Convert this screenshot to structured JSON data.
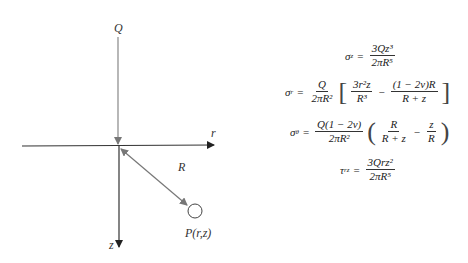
{
  "diagram": {
    "labels": {
      "load": "Q",
      "r_axis": "r",
      "z_axis": "z",
      "distance": "R",
      "point": "P(r,z)"
    },
    "colors": {
      "axis": "#333333",
      "grey_line": "#888888",
      "background": "#ffffff"
    }
  },
  "equations": {
    "sigma_z": {
      "lhs": "σ",
      "sub": "z",
      "eq": "=",
      "num": "3Qz³",
      "den": "2πR⁵"
    },
    "sigma_r": {
      "lhs": "σ",
      "sub": "r",
      "eq": "=",
      "coef_num": "Q",
      "coef_den": "2πR²",
      "t1_num": "3r²z",
      "t1_den": "R³",
      "minus": "−",
      "t2_num": "(1 − 2v)R",
      "t2_den": "R + z",
      "lbr": "[",
      "rbr": "]"
    },
    "sigma_theta": {
      "lhs": "σ",
      "sub": "θ",
      "eq": "=",
      "coef_num": "Q(1 − 2v)",
      "coef_den": "2πR²",
      "t1_num": "R",
      "t1_den": "R + z",
      "minus": "−",
      "t2_num": "z",
      "t2_den": "R",
      "lbr": "(",
      "rbr": ")"
    },
    "tau_rz": {
      "lhs": "τ",
      "sub": "rz",
      "eq": "=",
      "num": "3Qrz²",
      "den": "2πR⁵"
    }
  }
}
